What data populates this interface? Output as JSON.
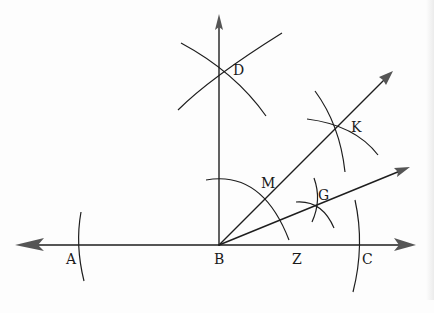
{
  "diagram": {
    "type": "geometric-construction",
    "colors": {
      "ink": "#1e1e1e",
      "arrow": "#555555",
      "paper": "#fdfdfd"
    },
    "points": {
      "A": {
        "label": "A",
        "x": 80,
        "y": 245
      },
      "B": {
        "label": "B",
        "x": 219,
        "y": 245
      },
      "Z": {
        "label": "Z",
        "x": 289,
        "y": 245
      },
      "C": {
        "label": "C",
        "x": 360,
        "y": 245
      },
      "D": {
        "label": "D",
        "x": 219,
        "y": 67
      },
      "K": {
        "label": "K",
        "x": 338,
        "y": 125
      },
      "M": {
        "label": "M",
        "x": 268,
        "y": 196
      },
      "G": {
        "label": "G",
        "x": 317,
        "y": 206
      }
    },
    "lines": [
      {
        "name": "line-AC",
        "from": [
          15,
          245
        ],
        "to": [
          415,
          245
        ],
        "arrows": "both"
      },
      {
        "name": "ray-BD",
        "from": [
          219,
          245
        ],
        "to": [
          219,
          15
        ],
        "arrows": "end"
      },
      {
        "name": "ray-BK",
        "from": [
          219,
          245
        ],
        "to": [
          392,
          72
        ],
        "arrows": "end"
      },
      {
        "name": "ray-BG",
        "from": [
          219,
          245
        ],
        "to": [
          410,
          167
        ],
        "arrows": "end"
      }
    ],
    "labels": [
      "D",
      "K",
      "M",
      "G",
      "A",
      "B",
      "Z",
      "C"
    ]
  }
}
